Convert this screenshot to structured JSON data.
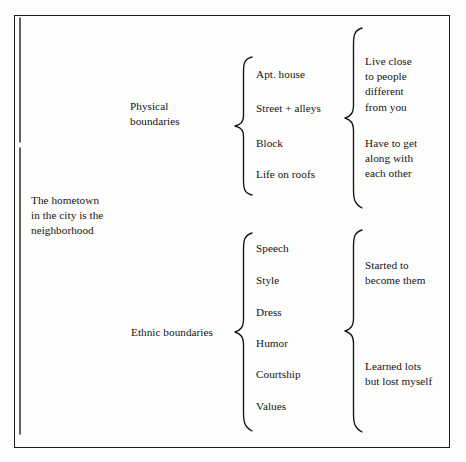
{
  "figure": {
    "type": "bracket-diagram",
    "title_text": "The hometown in the city is the neighborhood",
    "root": {
      "label": "The hometown\nin the city is the\nneighborhood"
    },
    "branches": [
      {
        "name": "physical",
        "label": "Physical\nboundaries",
        "items": [
          "Apt. house",
          "Street + alleys",
          "Block",
          "Life on roofs"
        ],
        "outcomes": [
          "Live close\nto people\ndifferent\nfrom you",
          "Have to get\nalong with\neach other"
        ]
      },
      {
        "name": "ethnic",
        "label": "Ethnic boundaries",
        "items": [
          "Speech",
          "Style",
          "Dress",
          "Humor",
          "Courtship",
          "Values"
        ],
        "outcomes": [
          "Started to\nbecome them",
          "Learned lots\nbut lost myself"
        ]
      }
    ],
    "colors": {
      "ink": "#151515",
      "paper": "#fdfdfc",
      "frame": "#1a1a1a"
    }
  }
}
